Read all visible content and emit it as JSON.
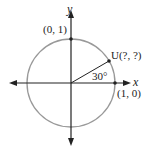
{
  "diagram": {
    "type": "unit-circle",
    "axes": {
      "x_label": "x",
      "y_label": "y"
    },
    "points": [
      {
        "id": "top",
        "label": "(0, 1)"
      },
      {
        "id": "right",
        "label": "(1, 0)"
      },
      {
        "id": "u",
        "label": "U(?, ?)"
      }
    ],
    "angle_label": "30°",
    "colors": {
      "circle": "#999999",
      "axes": "#222222",
      "text": "#222222"
    }
  }
}
